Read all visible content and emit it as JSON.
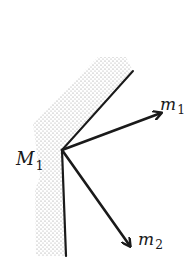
{
  "diagram": {
    "vertex": {
      "name": "M",
      "subscript": "1"
    },
    "vectors": [
      {
        "name": "m",
        "subscript": "1",
        "direction": "upper-right"
      },
      {
        "name": "m",
        "subscript": "2",
        "direction": "lower-right"
      }
    ],
    "surface": {
      "description": "shaded wall with a convex corner at the vertex",
      "fill_pattern": "stipple"
    }
  },
  "colors": {
    "line": "#1a1a1a",
    "stipple": "#9a9a9a",
    "background": "#ffffff"
  }
}
